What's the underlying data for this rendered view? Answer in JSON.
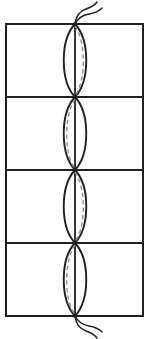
{
  "figure": {
    "title": "",
    "caption": "",
    "background_color": "#ffffff",
    "canvas": {
      "width": 149,
      "height": 339
    }
  },
  "diagram_data": {
    "type": "geometric-line-diagram",
    "description": "Vertical rectangle subdivided by three horizontal lines into four equal cells; a vertical axis runs down the centre; a lens (vesica) formed by two mirrored arcs fills each cell; a grey dashed arc lies inside each lens, alternating right and left; two wavy filament tails emerge from the top and bottom nodes.",
    "stroke_color": "#231f20",
    "dashed_stroke_color": "#8c8c8c",
    "frame": {
      "x": 6,
      "y": 24,
      "width": 137,
      "height": 292,
      "stroke_width": 2.0
    },
    "axis": {
      "x": 75,
      "y_top": 24,
      "y_bottom": 316,
      "stroke_width": 1.8
    },
    "dividers_y": [
      97,
      170,
      243
    ],
    "nodes_y": [
      24,
      97,
      170,
      243,
      316
    ],
    "cells": [
      {
        "index": 1,
        "y_top": 24,
        "y_bottom": 97,
        "lens_half_width": 15,
        "dashed_side": "right",
        "dashed_offset": 11
      },
      {
        "index": 2,
        "y_top": 97,
        "y_bottom": 170,
        "lens_half_width": 15,
        "dashed_side": "left",
        "dashed_offset": 11
      },
      {
        "index": 3,
        "y_top": 170,
        "y_bottom": 243,
        "lens_half_width": 15,
        "dashed_side": "right",
        "dashed_offset": 11
      },
      {
        "index": 4,
        "y_top": 243,
        "y_bottom": 316,
        "lens_half_width": 15,
        "dashed_side": "left",
        "dashed_offset": 11
      }
    ],
    "tails": [
      {
        "position": "top",
        "anchor_x": 75,
        "anchor_y": 24,
        "strand_count": 2,
        "direction": "up-right"
      },
      {
        "position": "bottom",
        "anchor_x": 75,
        "anchor_y": 316,
        "strand_count": 2,
        "direction": "down-right"
      }
    ]
  }
}
